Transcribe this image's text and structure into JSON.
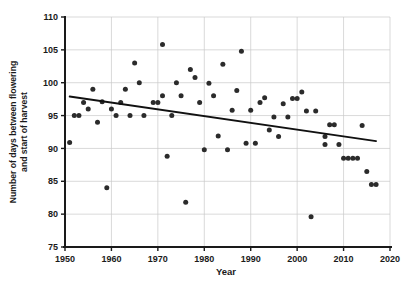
{
  "chart_data": {
    "type": "scatter",
    "title": "",
    "xlabel": "Year",
    "ylabel": "Number of days between flowering and start of harvest",
    "xlim": [
      1950,
      2020
    ],
    "ylim": [
      75,
      110
    ],
    "xticks": [
      1950,
      1960,
      1970,
      1980,
      1990,
      2000,
      2010,
      2020
    ],
    "xticklabels": [
      "1950",
      "1960",
      "1970",
      "1980",
      "1990",
      "2000",
      "2010",
      "2020"
    ],
    "yticks": [
      75,
      80,
      85,
      90,
      95,
      100,
      105,
      110
    ],
    "yticklabels": [
      "75",
      "80",
      "85",
      "90",
      "95",
      "100",
      "105",
      "110"
    ],
    "grid": true,
    "legend": null,
    "marker": "filled-circle",
    "marker_color": "#2b2b2b",
    "trendline": {
      "type": "linear-fit",
      "color": "#111111",
      "x_start": 1951,
      "y_start": 97.9,
      "x_end": 2017,
      "y_end": 91.1
    },
    "points": [
      {
        "x": 1951,
        "y": 90.9
      },
      {
        "x": 1952,
        "y": 95.0
      },
      {
        "x": 1953,
        "y": 95.0
      },
      {
        "x": 1954,
        "y": 97.0
      },
      {
        "x": 1955,
        "y": 96.0
      },
      {
        "x": 1956,
        "y": 99.0
      },
      {
        "x": 1957,
        "y": 94.0
      },
      {
        "x": 1958,
        "y": 97.1
      },
      {
        "x": 1959,
        "y": 84.0
      },
      {
        "x": 1960,
        "y": 96.0
      },
      {
        "x": 1961,
        "y": 95.0
      },
      {
        "x": 1962,
        "y": 97.0
      },
      {
        "x": 1963,
        "y": 99.0
      },
      {
        "x": 1964,
        "y": 95.0
      },
      {
        "x": 1965,
        "y": 103.0
      },
      {
        "x": 1966,
        "y": 100.0
      },
      {
        "x": 1967,
        "y": 95.0
      },
      {
        "x": 1969,
        "y": 97.0
      },
      {
        "x": 1970,
        "y": 97.0
      },
      {
        "x": 1971,
        "y": 98.0
      },
      {
        "x": 1971,
        "y": 105.8
      },
      {
        "x": 1972,
        "y": 88.8
      },
      {
        "x": 1973,
        "y": 95.0
      },
      {
        "x": 1974,
        "y": 100.0
      },
      {
        "x": 1975,
        "y": 98.0
      },
      {
        "x": 1976,
        "y": 81.8
      },
      {
        "x": 1977,
        "y": 102.0
      },
      {
        "x": 1978,
        "y": 100.8
      },
      {
        "x": 1979,
        "y": 97.0
      },
      {
        "x": 1980,
        "y": 89.8
      },
      {
        "x": 1981,
        "y": 99.9
      },
      {
        "x": 1982,
        "y": 98.0
      },
      {
        "x": 1983,
        "y": 91.9
      },
      {
        "x": 1984,
        "y": 102.8
      },
      {
        "x": 1985,
        "y": 89.8
      },
      {
        "x": 1986,
        "y": 95.8
      },
      {
        "x": 1987,
        "y": 98.8
      },
      {
        "x": 1988,
        "y": 104.8
      },
      {
        "x": 1989,
        "y": 90.8
      },
      {
        "x": 1990,
        "y": 95.8
      },
      {
        "x": 1991,
        "y": 90.8
      },
      {
        "x": 1992,
        "y": 97.0
      },
      {
        "x": 1993,
        "y": 97.7
      },
      {
        "x": 1994,
        "y": 92.8
      },
      {
        "x": 1995,
        "y": 94.8
      },
      {
        "x": 1996,
        "y": 91.8
      },
      {
        "x": 1997,
        "y": 96.8
      },
      {
        "x": 1998,
        "y": 94.8
      },
      {
        "x": 1999,
        "y": 97.6
      },
      {
        "x": 2000,
        "y": 97.6
      },
      {
        "x": 2001,
        "y": 98.6
      },
      {
        "x": 2002,
        "y": 95.7
      },
      {
        "x": 2003,
        "y": 79.6
      },
      {
        "x": 2004,
        "y": 95.7
      },
      {
        "x": 2006,
        "y": 90.6
      },
      {
        "x": 2006,
        "y": 91.8
      },
      {
        "x": 2007,
        "y": 93.6
      },
      {
        "x": 2008,
        "y": 93.6
      },
      {
        "x": 2009,
        "y": 90.6
      },
      {
        "x": 2010,
        "y": 88.5
      },
      {
        "x": 2011,
        "y": 88.5
      },
      {
        "x": 2012,
        "y": 88.5
      },
      {
        "x": 2013,
        "y": 88.5
      },
      {
        "x": 2014,
        "y": 93.5
      },
      {
        "x": 2015,
        "y": 86.5
      },
      {
        "x": 2016,
        "y": 84.5
      },
      {
        "x": 2017,
        "y": 84.5
      }
    ]
  }
}
